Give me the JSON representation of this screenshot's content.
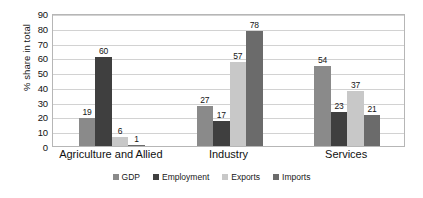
{
  "chart_data": {
    "type": "bar",
    "title": "",
    "subtitle": "",
    "xlabel": "",
    "ylabel": "% share in total",
    "ylim": [
      0,
      90
    ],
    "ytick_step": 10,
    "yticks": [
      90,
      80,
      70,
      60,
      50,
      40,
      30,
      20,
      10,
      0
    ],
    "grid": true,
    "grid_axis": "y",
    "legend_position": "bottom",
    "categories": [
      "Agriculture and Allied",
      "Industry",
      "Services"
    ],
    "series": [
      {
        "name": "GDP",
        "values": [
          19,
          27,
          54
        ],
        "color": "#8a8a8a"
      },
      {
        "name": "Employment",
        "values": [
          60,
          17,
          23
        ],
        "color": "#3f3f3f"
      },
      {
        "name": "Exports",
        "values": [
          6,
          57,
          37
        ],
        "color": "#c8c8c8"
      },
      {
        "name": "Imports",
        "values": [
          1,
          78,
          21
        ],
        "color": "#6b6b6b"
      }
    ],
    "data_labels": [
      [
        "19",
        "60",
        "6",
        "1"
      ],
      [
        "27",
        "17",
        "57",
        "78"
      ],
      [
        "54",
        "23",
        "37",
        "21"
      ]
    ]
  },
  "style": {
    "background": "#ffffff",
    "plot_border": "#b6b6b6",
    "gridline": "#d2d2d2",
    "text": "#121212"
  }
}
